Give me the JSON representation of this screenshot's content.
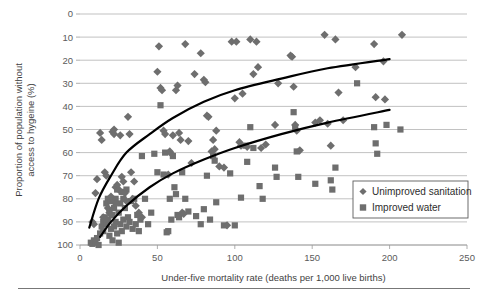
{
  "chart_data": {
    "type": "scatter",
    "title": "",
    "xlabel": "Under-five mortality rate (deaths per 1,000 live births)",
    "ylabel": "Proportion of population without access to hygeine (%)",
    "xlim": [
      0,
      250
    ],
    "ylim": [
      0,
      100
    ],
    "xticks": [
      0,
      50,
      100,
      150,
      200,
      250
    ],
    "yticks": [
      0,
      10,
      20,
      30,
      40,
      50,
      60,
      70,
      80,
      90,
      100
    ],
    "grid": "horizontal",
    "legend_position": "bottom-right",
    "marker_color": "#6e6e6e",
    "trendline_color": "#000000",
    "series": [
      {
        "name": "Unimproved sanitation",
        "marker": "diamond",
        "color": "#6e6e6e",
        "points": [
          [
            8,
            10
          ],
          [
            9,
            9
          ],
          [
            10,
            22.5
          ],
          [
            11,
            28.5
          ],
          [
            13,
            48.5
          ],
          [
            14,
            45.5
          ],
          [
            15,
            12
          ],
          [
            16,
            31.5
          ],
          [
            17,
            30
          ],
          [
            18,
            16
          ],
          [
            19,
            14
          ],
          [
            20,
            13
          ],
          [
            20,
            21
          ],
          [
            21,
            49
          ],
          [
            22,
            48
          ],
          [
            22,
            50
          ],
          [
            23,
            25
          ],
          [
            23,
            18
          ],
          [
            24,
            26
          ],
          [
            25,
            24
          ],
          [
            26,
            47.5
          ],
          [
            27,
            29.5
          ],
          [
            28,
            27.5
          ],
          [
            29,
            22.5
          ],
          [
            30,
            19
          ],
          [
            31,
            55.5
          ],
          [
            32,
            48
          ],
          [
            33,
            31.5
          ],
          [
            34,
            20
          ],
          [
            35,
            27.5
          ],
          [
            36,
            17
          ],
          [
            38,
            14
          ],
          [
            40,
            12
          ],
          [
            50,
            75
          ],
          [
            51,
            86
          ],
          [
            52,
            68
          ],
          [
            53,
            67
          ],
          [
            54,
            49.5
          ],
          [
            55,
            48
          ],
          [
            57,
            30.5
          ],
          [
            58,
            40.5
          ],
          [
            59,
            39.5
          ],
          [
            60,
            47.5
          ],
          [
            62,
            67
          ],
          [
            63,
            69
          ],
          [
            64,
            48.5
          ],
          [
            65,
            45.5
          ],
          [
            66,
            14
          ],
          [
            67,
            13.5
          ],
          [
            68,
            87
          ],
          [
            70,
            45
          ],
          [
            72,
            35.5
          ],
          [
            74,
            74
          ],
          [
            78,
            83
          ],
          [
            80,
            71.5
          ],
          [
            81,
            70.5
          ],
          [
            82,
            56
          ],
          [
            83,
            55.5
          ],
          [
            85,
            40.5
          ],
          [
            86,
            45.5
          ],
          [
            87,
            41.5
          ],
          [
            88,
            49.5
          ],
          [
            90,
            34
          ],
          [
            93,
            33.5
          ],
          [
            95,
            8.5
          ],
          [
            98,
            88
          ],
          [
            100,
            63.5
          ],
          [
            101,
            88
          ],
          [
            103,
            44.5
          ],
          [
            104,
            43
          ],
          [
            105,
            65.5
          ],
          [
            108,
            42.5
          ],
          [
            110,
            89
          ],
          [
            112,
            74
          ],
          [
            114,
            88
          ],
          [
            115,
            77
          ],
          [
            117,
            42
          ],
          [
            120,
            43.5
          ],
          [
            126,
            52
          ],
          [
            128,
            70
          ],
          [
            136,
            82
          ],
          [
            137,
            81.5
          ],
          [
            138,
            68.5
          ],
          [
            139,
            52
          ],
          [
            140,
            49.5
          ],
          [
            142,
            41
          ],
          [
            152,
            53
          ],
          [
            155,
            54
          ],
          [
            158,
            91
          ],
          [
            160,
            52.5
          ],
          [
            162,
            43
          ],
          [
            165,
            89
          ],
          [
            167,
            66
          ],
          [
            170,
            54
          ],
          [
            178,
            77
          ],
          [
            190,
            87
          ],
          [
            191,
            64
          ],
          [
            196,
            79.5
          ],
          [
            197,
            63
          ],
          [
            208,
            91
          ]
        ]
      },
      {
        "name": "Improved water",
        "marker": "square",
        "color": "#6e6e6e",
        "points": [
          [
            7,
            1
          ],
          [
            8,
            0.5
          ],
          [
            9,
            2
          ],
          [
            10,
            1
          ],
          [
            11,
            3
          ],
          [
            12,
            0
          ],
          [
            13,
            5
          ],
          [
            14,
            8
          ],
          [
            15,
            10
          ],
          [
            15,
            6
          ],
          [
            16,
            12
          ],
          [
            17,
            18
          ],
          [
            17,
            9
          ],
          [
            18,
            20
          ],
          [
            18,
            11
          ],
          [
            19,
            15
          ],
          [
            19,
            4
          ],
          [
            20,
            19
          ],
          [
            20,
            7
          ],
          [
            21,
            13
          ],
          [
            21,
            2
          ],
          [
            22,
            16
          ],
          [
            22,
            8
          ],
          [
            23,
            20
          ],
          [
            23,
            10
          ],
          [
            24,
            24
          ],
          [
            24,
            5
          ],
          [
            25,
            14
          ],
          [
            25,
            1
          ],
          [
            26,
            18
          ],
          [
            26,
            9
          ],
          [
            27,
            23
          ],
          [
            27,
            6
          ],
          [
            28,
            20
          ],
          [
            28,
            11
          ],
          [
            29,
            16
          ],
          [
            30,
            8
          ],
          [
            30,
            24
          ],
          [
            31,
            12
          ],
          [
            32,
            10
          ],
          [
            33,
            19
          ],
          [
            34,
            7
          ],
          [
            35,
            20
          ],
          [
            36,
            9
          ],
          [
            37,
            13
          ],
          [
            38,
            6
          ],
          [
            39,
            11
          ],
          [
            40,
            38.5
          ],
          [
            42,
            20
          ],
          [
            44,
            9
          ],
          [
            46,
            14
          ],
          [
            48,
            39.5
          ],
          [
            50,
            31.5
          ],
          [
            52,
            60.5
          ],
          [
            54,
            30.5
          ],
          [
            55,
            40
          ],
          [
            56,
            5.5
          ],
          [
            57,
            6
          ],
          [
            58,
            20
          ],
          [
            59,
            11
          ],
          [
            60,
            38.5
          ],
          [
            61,
            25
          ],
          [
            62,
            22
          ],
          [
            63,
            13
          ],
          [
            64,
            12
          ],
          [
            66,
            31.5
          ],
          [
            68,
            20
          ],
          [
            70,
            14.5
          ],
          [
            75,
            12.5
          ],
          [
            78,
            9
          ],
          [
            80,
            15.5
          ],
          [
            82,
            30
          ],
          [
            84,
            11
          ],
          [
            86,
            38.5
          ],
          [
            87,
            36.5
          ],
          [
            88,
            18.5
          ],
          [
            93,
            8.5
          ],
          [
            97,
            31
          ],
          [
            100,
            8.5
          ],
          [
            104,
            20.5
          ],
          [
            107,
            43
          ],
          [
            108,
            36
          ],
          [
            110,
            51
          ],
          [
            112,
            42
          ],
          [
            116,
            25.5
          ],
          [
            118,
            20
          ],
          [
            126,
            33.5
          ],
          [
            127,
            29.5
          ],
          [
            138,
            57.5
          ],
          [
            139,
            51
          ],
          [
            140,
            40.5
          ],
          [
            141,
            29.5
          ],
          [
            152,
            26.5
          ],
          [
            162,
            28
          ],
          [
            163,
            24
          ],
          [
            165,
            33.5
          ],
          [
            179,
            70
          ],
          [
            190,
            51
          ],
          [
            191,
            44
          ],
          [
            192,
            39.5
          ],
          [
            198,
            52
          ],
          [
            207,
            50
          ]
        ]
      }
    ],
    "trendlines": [
      {
        "name": "Unimproved sanitation trend",
        "for_series": "Unimproved sanitation",
        "shape": "logarithmic",
        "x_start": 6,
        "x_end": 200,
        "y_start": 7.5,
        "y_end": 80.5,
        "control_points": [
          [
            6,
            7.5
          ],
          [
            12,
            20
          ],
          [
            20,
            30
          ],
          [
            30,
            40
          ],
          [
            45,
            48
          ],
          [
            60,
            55
          ],
          [
            80,
            62
          ],
          [
            100,
            67
          ],
          [
            130,
            72
          ],
          [
            160,
            76.5
          ],
          [
            200,
            80.5
          ]
        ]
      },
      {
        "name": "Improved water trend",
        "for_series": "Improved water",
        "shape": "logarithmic",
        "x_start": 13,
        "x_end": 200,
        "y_start": 3.5,
        "y_end": 58.5,
        "control_points": [
          [
            13,
            3.5
          ],
          [
            20,
            10
          ],
          [
            30,
            17
          ],
          [
            45,
            25
          ],
          [
            60,
            31
          ],
          [
            80,
            37
          ],
          [
            100,
            42
          ],
          [
            130,
            48
          ],
          [
            160,
            53
          ],
          [
            200,
            58.5
          ]
        ]
      }
    ]
  },
  "axes": {
    "y_title": "Proportion of population without\naccess to hygeine (%)",
    "y_title_line1": "Proportion of population without",
    "y_title_line2": "access to hygeine (%)",
    "x_title": "Under-five mortality rate (deaths per 1,000 live births)",
    "y_tick_labels": [
      "100",
      "90",
      "80",
      "70",
      "60",
      "50",
      "40",
      "30",
      "20",
      "10",
      "0"
    ],
    "x_tick_labels": [
      "0",
      "50",
      "100",
      "150",
      "200",
      "250"
    ]
  },
  "legend": {
    "items": [
      {
        "label": "Unimproved sanitation",
        "marker": "diamond",
        "color": "#6e6e6e"
      },
      {
        "label": "Improved water",
        "marker": "square",
        "color": "#6e6e6e"
      }
    ]
  }
}
